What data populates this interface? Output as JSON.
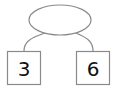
{
  "diagram": {
    "type": "number-bond",
    "colors": {
      "stroke": "#8a8a8a",
      "fill": "#ffffff",
      "text": "#111111"
    },
    "whole": {
      "label": "",
      "shape": "ellipse"
    },
    "parts": [
      {
        "label": "3",
        "shape": "square"
      },
      {
        "label": "6",
        "shape": "square"
      }
    ]
  }
}
